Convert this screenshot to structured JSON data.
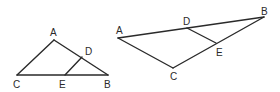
{
  "figures": [
    {
      "name": "left-triangle",
      "labels": {
        "A": "A",
        "B": "B",
        "C": "C",
        "D": "D",
        "E": "E"
      }
    },
    {
      "name": "right-triangle",
      "labels": {
        "A": "A",
        "B": "B",
        "C": "C",
        "D": "D",
        "E": "E"
      }
    }
  ]
}
